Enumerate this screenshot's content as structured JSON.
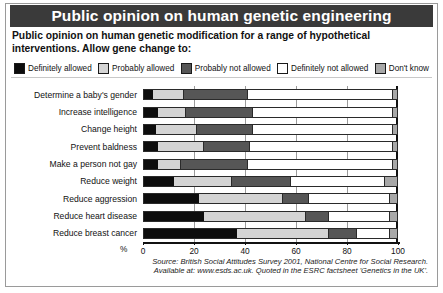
{
  "title": "Public opinion on human genetic engineering",
  "subtitle": "Public opinion on human genetic modification for a range of hypothetical interventions. Allow gene change to:",
  "legend": [
    {
      "label": "Definitely allowed",
      "color": "#0d0d0d"
    },
    {
      "label": "Probably allowed",
      "color": "#d4d4d4"
    },
    {
      "label": "Probably not allowed",
      "color": "#565656"
    },
    {
      "label": "Definitely not allowed",
      "color": "#ffffff"
    },
    {
      "label": "Don't know",
      "color": "#a8a8a8"
    }
  ],
  "axis": {
    "percent_symbol": "%",
    "ticks": [
      "0",
      "20",
      "40",
      "60",
      "80",
      "100"
    ],
    "tick_values": [
      0,
      20,
      40,
      60,
      80,
      100
    ],
    "min": 0,
    "max": 100
  },
  "source": {
    "line1": "Source: British Social Attitudes Survey 2001, National Centre for Social Research.",
    "line2": "Available at: www.esds.ac.uk. Quoted in the ESRC factsheet 'Genetics in the UK'."
  },
  "chart_data": {
    "type": "bar",
    "orientation": "horizontal",
    "stacked": true,
    "normalized_percent": true,
    "title": "Public opinion on human genetic engineering",
    "subtitle": "Public opinion on human genetic modification for a range of hypothetical interventions. Allow gene change to:",
    "xlabel": "%",
    "ylabel": "",
    "xlim": [
      0,
      100
    ],
    "xticks": [
      0,
      20,
      40,
      60,
      80,
      100
    ],
    "grid": true,
    "legend_position": "top",
    "categories": [
      "Determine a baby's gender",
      "Increase intelligence",
      "Change height",
      "Prevent baldness",
      "Make a person not gay",
      "Reduce weight",
      "Reduce aggression",
      "Reduce heart disease",
      "Reduce breast cancer"
    ],
    "series": [
      {
        "name": "Definitely allowed",
        "color": "#0d0d0d",
        "values": [
          4,
          6,
          5,
          6,
          6,
          12,
          22,
          24,
          37
        ]
      },
      {
        "name": "Probably allowed",
        "color": "#d4d4d4",
        "values": [
          12,
          11,
          16,
          18,
          9,
          23,
          33,
          40,
          36
        ]
      },
      {
        "name": "Probably not allowed",
        "color": "#565656",
        "values": [
          25,
          26,
          22,
          18,
          26,
          23,
          10,
          9,
          11
        ]
      },
      {
        "name": "Definitely not allowed",
        "color": "#ffffff",
        "values": [
          57,
          55,
          55,
          56,
          57,
          37,
          32,
          24,
          13
        ]
      },
      {
        "name": "Don't know",
        "color": "#a8a8a8",
        "values": [
          2,
          2,
          2,
          2,
          2,
          5,
          3,
          3,
          3
        ]
      }
    ]
  }
}
